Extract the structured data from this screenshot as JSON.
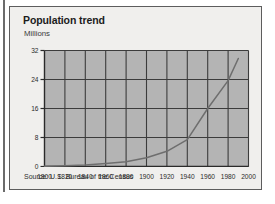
{
  "figure": {
    "title": "Population trend",
    "units_label": "Millions",
    "source": "Source: U.S. Bureau of the Census"
  },
  "colors": {
    "card_background": "#f0efed",
    "card_border": "#5d5d5d",
    "plot_fill": "#b4b4b4",
    "grid_line": "#3c3c3c",
    "axis_line": "#2a2a2a",
    "series_line": "#6e6e6e",
    "text": "#1c1c1c",
    "left_rule": "#6b6b6b"
  },
  "chart_data": {
    "type": "line",
    "title": "Population trend",
    "xlabel": "",
    "ylabel": "Millions",
    "xlim": [
      1800,
      2000
    ],
    "ylim": [
      0,
      32
    ],
    "xticks": [
      1800,
      1820,
      1840,
      1860,
      1880,
      1900,
      1920,
      1940,
      1960,
      1980,
      2000
    ],
    "yticks": [
      0,
      8,
      16,
      24,
      32
    ],
    "grid": true,
    "legend_position": "none",
    "x": [
      1800,
      1820,
      1840,
      1860,
      1880,
      1900,
      1920,
      1940,
      1960,
      1980,
      1990
    ],
    "values": [
      0.1,
      0.2,
      0.4,
      0.8,
      1.3,
      2.4,
      4.2,
      7.4,
      16.0,
      23.7,
      29.8
    ],
    "series": [
      {
        "name": "Population",
        "x": [
          1800,
          1820,
          1840,
          1860,
          1880,
          1900,
          1920,
          1940,
          1960,
          1980,
          1990
        ],
        "values": [
          0.1,
          0.2,
          0.4,
          0.8,
          1.3,
          2.4,
          4.2,
          7.4,
          16.0,
          23.7,
          29.8
        ]
      }
    ]
  },
  "ytick_labels": [
    "32",
    "24",
    "16",
    "8",
    "0"
  ],
  "xtick_labels": [
    "1800",
    "1820",
    "1840",
    "1860",
    "1880",
    "1900",
    "1920",
    "1940",
    "1960",
    "1980",
    "2000"
  ]
}
